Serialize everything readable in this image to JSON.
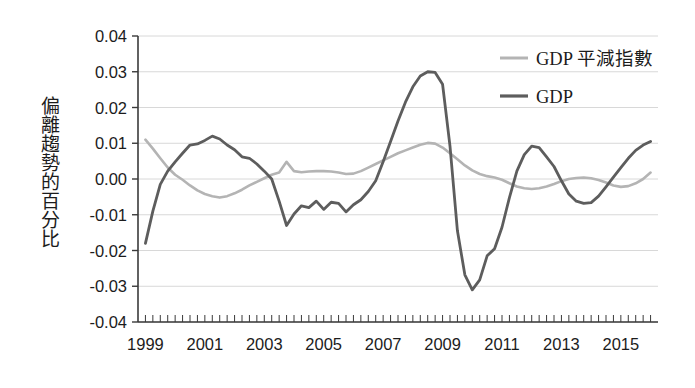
{
  "chart_data": {
    "type": "line",
    "title": "",
    "xlabel": "",
    "ylabel": "偏離趨勢的百分比",
    "xlim": [
      1998.75,
      2016.25
    ],
    "ylim": [
      -0.04,
      0.04
    ],
    "grid": true,
    "legend_position": "top-right",
    "ytick_labels": [
      "0.04",
      "0.03",
      "0.02",
      "0.01",
      "0.00",
      "-0.01",
      "-0.02",
      "-0.03",
      "-0.04"
    ],
    "ytick_values": [
      0.04,
      0.03,
      0.02,
      0.01,
      0.0,
      -0.01,
      -0.02,
      -0.03,
      -0.04
    ],
    "xtick_labels": [
      "1999",
      "2001",
      "2003",
      "2005",
      "2007",
      "2009",
      "2011",
      "2013",
      "2015"
    ],
    "xtick_values": [
      1999,
      2001,
      2003,
      2005,
      2007,
      2009,
      2011,
      2013,
      2015
    ],
    "minor_tick_interval": 0.25,
    "colors": {
      "deflator": "#b4b4b4",
      "gdp": "#5d5d5d",
      "axis": "#3a3a3a",
      "grid": "#d8d8d8",
      "text": "#1c1c1c"
    },
    "series": [
      {
        "name": "GDP 平減指數",
        "color": "#b4b4b4",
        "x": [
          1999.0,
          1999.25,
          1999.5,
          1999.75,
          2000.0,
          2000.25,
          2000.5,
          2000.75,
          2001.0,
          2001.25,
          2001.5,
          2001.75,
          2002.0,
          2002.25,
          2002.5,
          2002.75,
          2003.0,
          2003.25,
          2003.5,
          2003.75,
          2004.0,
          2004.25,
          2004.5,
          2004.75,
          2005.0,
          2005.25,
          2005.5,
          2005.75,
          2006.0,
          2006.25,
          2006.5,
          2006.75,
          2007.0,
          2007.25,
          2007.5,
          2007.75,
          2008.0,
          2008.25,
          2008.5,
          2008.75,
          2009.0,
          2009.25,
          2009.5,
          2009.75,
          2010.0,
          2010.25,
          2010.5,
          2010.75,
          2011.0,
          2011.25,
          2011.5,
          2011.75,
          2012.0,
          2012.25,
          2012.5,
          2012.75,
          2013.0,
          2013.25,
          2013.5,
          2013.75,
          2014.0,
          2014.25,
          2014.5,
          2014.75,
          2015.0,
          2015.25,
          2015.5,
          2015.75,
          2016.0
        ],
        "y": [
          0.011,
          0.0085,
          0.0058,
          0.0032,
          0.0012,
          -0.0002,
          -0.0018,
          -0.0032,
          -0.0042,
          -0.0048,
          -0.0052,
          -0.0048,
          -0.004,
          -0.003,
          -0.0018,
          -0.0008,
          0.0002,
          0.0012,
          0.0018,
          0.0048,
          0.0022,
          0.0019,
          0.0021,
          0.0022,
          0.0022,
          0.0021,
          0.0018,
          0.0014,
          0.0015,
          0.0022,
          0.0032,
          0.0042,
          0.0052,
          0.0062,
          0.0072,
          0.008,
          0.0088,
          0.0096,
          0.0101,
          0.0099,
          0.0088,
          0.0072,
          0.0055,
          0.0038,
          0.0024,
          0.0014,
          0.0008,
          0.0004,
          -0.0002,
          -0.0012,
          -0.0021,
          -0.0026,
          -0.0028,
          -0.0026,
          -0.0021,
          -0.0014,
          -0.0006,
          0.0,
          0.0003,
          0.0004,
          0.0002,
          -0.0003,
          -0.001,
          -0.0018,
          -0.0022,
          -0.002,
          -0.0012,
          0.0,
          0.0018
        ]
      },
      {
        "name": "GDP",
        "color": "#5d5d5d",
        "x": [
          1999.0,
          1999.25,
          1999.5,
          1999.75,
          2000.0,
          2000.25,
          2000.5,
          2000.75,
          2001.0,
          2001.25,
          2001.5,
          2001.75,
          2002.0,
          2002.25,
          2002.5,
          2002.75,
          2003.0,
          2003.25,
          2003.5,
          2003.75,
          2004.0,
          2004.25,
          2004.5,
          2004.75,
          2005.0,
          2005.25,
          2005.5,
          2005.75,
          2006.0,
          2006.25,
          2006.5,
          2006.75,
          2007.0,
          2007.25,
          2007.5,
          2007.75,
          2008.0,
          2008.25,
          2008.5,
          2008.75,
          2009.0,
          2009.25,
          2009.5,
          2009.75,
          2010.0,
          2010.25,
          2010.5,
          2010.75,
          2011.0,
          2011.25,
          2011.5,
          2011.75,
          2012.0,
          2012.25,
          2012.5,
          2012.75,
          2013.0,
          2013.25,
          2013.5,
          2013.75,
          2014.0,
          2014.25,
          2014.5,
          2014.75,
          2015.0,
          2015.25,
          2015.5,
          2015.75,
          2016.0
        ],
        "y": [
          -0.018,
          -0.009,
          -0.0015,
          0.0022,
          0.0048,
          0.0072,
          0.0095,
          0.0098,
          0.0108,
          0.012,
          0.0112,
          0.0095,
          0.0082,
          0.0062,
          0.0058,
          0.0042,
          0.0022,
          0.0,
          -0.0062,
          -0.013,
          -0.0098,
          -0.0075,
          -0.008,
          -0.0062,
          -0.0085,
          -0.0065,
          -0.0068,
          -0.0092,
          -0.0072,
          -0.0058,
          -0.0035,
          -0.0005,
          0.0048,
          0.0105,
          0.0162,
          0.0215,
          0.0258,
          0.0288,
          0.03,
          0.0298,
          0.0265,
          0.0092,
          -0.0145,
          -0.0268,
          -0.031,
          -0.0282,
          -0.0215,
          -0.0195,
          -0.0135,
          -0.0052,
          0.0022,
          0.0068,
          0.0092,
          0.0088,
          0.0062,
          0.0035,
          -0.0005,
          -0.0042,
          -0.0062,
          -0.0068,
          -0.0066,
          -0.0048,
          -0.0022,
          0.0005,
          0.0032,
          0.0058,
          0.008,
          0.0095,
          0.0105
        ]
      }
    ]
  },
  "legend": {
    "entries": [
      {
        "label": "GDP 平減指數"
      },
      {
        "label": "GDP"
      }
    ]
  },
  "axis": {
    "y_title": "偏離趨勢的百分比"
  }
}
